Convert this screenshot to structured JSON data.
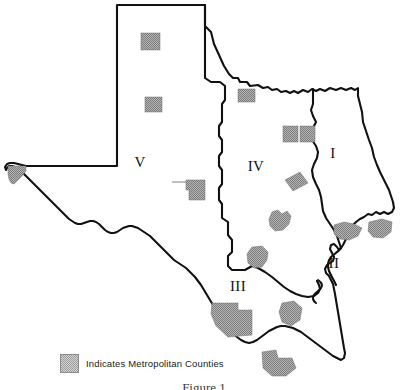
{
  "figure": {
    "caption": "Figure 1"
  },
  "legend": {
    "swatch_icon": "metro-county-swatch",
    "label": "Indicates Metropolitan Counties",
    "swatch_color": "#9d9d9d"
  },
  "map": {
    "state": "Texas",
    "outline_color": "#111111",
    "fill_color": "#ffffff",
    "metro_fill_color": "#9d9d9d",
    "regions": [
      {
        "id": "region-1",
        "label": "I",
        "x": 333,
        "y": 155
      },
      {
        "id": "region-2",
        "label": "II",
        "x": 334,
        "y": 265
      },
      {
        "id": "region-3",
        "label": "III",
        "x": 238,
        "y": 288
      },
      {
        "id": "region-4",
        "label": "IV",
        "x": 256,
        "y": 168
      },
      {
        "id": "region-5",
        "label": "V",
        "x": 140,
        "y": 164
      }
    ],
    "metro_county_count": 14,
    "metro_counties": [
      {
        "name": "metro-patch-panhandle-north",
        "x": 141,
        "y": 33
      },
      {
        "name": "metro-patch-panhandle-south",
        "x": 148,
        "y": 97
      },
      {
        "name": "metro-patch-el-paso",
        "x": 10,
        "y": 166
      },
      {
        "name": "metro-patch-red-river",
        "x": 238,
        "y": 89
      },
      {
        "name": "metro-patch-north-central-west",
        "x": 283,
        "y": 128
      },
      {
        "name": "metro-patch-north-central-east",
        "x": 301,
        "y": 128
      },
      {
        "name": "metro-patch-central-east",
        "x": 293,
        "y": 178
      },
      {
        "name": "metro-patch-west-central",
        "x": 187,
        "y": 182
      },
      {
        "name": "metro-patch-central",
        "x": 277,
        "y": 218
      },
      {
        "name": "metro-patch-south-central",
        "x": 259,
        "y": 258
      },
      {
        "name": "metro-patch-upper-coast",
        "x": 347,
        "y": 228
      },
      {
        "name": "metro-patch-southeast-corner",
        "x": 383,
        "y": 228
      },
      {
        "name": "metro-patch-southwest",
        "x": 230,
        "y": 312
      },
      {
        "name": "metro-patch-coastal-bend",
        "x": 292,
        "y": 312
      },
      {
        "name": "metro-patch-rio-grande-valley",
        "x": 272,
        "y": 362
      }
    ]
  }
}
